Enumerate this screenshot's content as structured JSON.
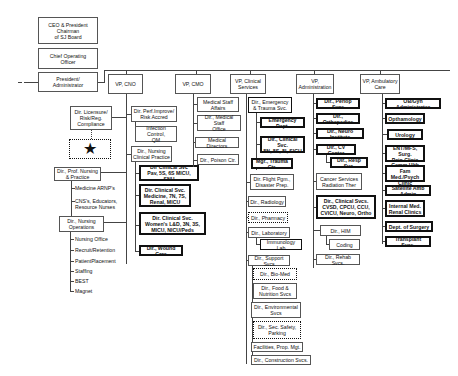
{
  "executive": {
    "ceo": "CEO & President\nChairman\nof SJ Board",
    "coo": "Chief Operating\nOfficer",
    "president": "President/\nAdministrator"
  },
  "vps": [
    {
      "label": "VP, CNO"
    },
    {
      "label": "VP, CMO"
    },
    {
      "label": "VP, Clinical\nServices"
    },
    {
      "label": "VP,\nAdministration"
    },
    {
      "label": "VP, Ambulatory\nCare"
    }
  ],
  "cno_left": {
    "licensure": "Dir. Licensure/\nRisk/Reg.\nCompliance",
    "star": "★",
    "prof_nursing": "Dir., Prof. Nursing\n& Practice",
    "prof_children": [
      "Medicine ARNP's",
      "CNS's, Educators,\nResource Nurses"
    ],
    "nursing_ops": "Dir., Nursing\nOperations",
    "ops_children": [
      "Nursing Office",
      "Recruit/Retention",
      "PatientPlacement",
      "Staffing",
      "BEST",
      "Magnet"
    ]
  },
  "cno_right": {
    "perf_improve": "Dir. Perf.Improve/\nRisk Accred",
    "infection": "Infection Control,\nQM",
    "nursing_clinical": "Dir., Nursing\nClinical Practice",
    "clinical_children": [
      "Dir Clinical Svc\nPav, 5S, 6S MICU, SNU",
      "Dir. Clinical Svc.\nMedicine, 7N, 7S,\nRenal, MICU",
      "Dir. Clinical Svc.\nWomen's L&D, 3N, 3S,\nMICU, NICU/Peds",
      "Dir., Wound Care"
    ]
  },
  "cmo": {
    "items": [
      "Medical Staff\nAffairs",
      "Dir., Medical Staff\nOffice",
      "Medical Directors",
      "Dir., Poison Ctr."
    ]
  },
  "clinical_services": {
    "emergency": "Dir., Emergency\n& Trauma Svc.",
    "emergency_children": [
      "Emergency Dept.",
      "Dir., Clinical Svc.\n8N, 8S, 8I, SICU",
      "Mgr., Trauma Ctr."
    ],
    "items": [
      "Dir. Flight Pgm.,\nDisaster Prep.",
      "Dir., Radiology",
      "Dir., Pharmacy",
      "Dir., Laboratory"
    ],
    "lab_child": "Immunology Lab",
    "support": "Dir., Support Svcs",
    "support_children": [
      "Dir., Bio-Med",
      "Dir., Food &\nNutrition Svcs",
      "Dir., Environmental\nSvcs",
      "Dir., Sec. Safety,\nParking",
      "Facilities, Prop. Mgt.",
      "Dir., Construction Svcs."
    ]
  },
  "administration": {
    "items": [
      "Dir., Periop Svcs",
      "Dir., Orthopedics",
      "Dir., Neuro Institute",
      "Dir., CV Center"
    ],
    "cv_child": "Dir., Resp Svc.",
    "cancer": "Cancer Services\nRadiation Ther",
    "cvsd": "Dir., Clinical Svcs.\nCVSD, CPCU, CCU,\nCVICU, Neuro, Ortho",
    "him": "Dir., HIM",
    "coding": "Coding",
    "rehab": "Dir., Rehab Svcs."
  },
  "ambulatory": {
    "items": [
      "OB/Gyn Administrator",
      "Opthamology",
      "Urology",
      "ENT/MFS, Surg.\nPain Clinic",
      "Comm.Hlth Fam\nMed./Psych Clinic",
      "Satellite Amb Admin",
      "Internal Med.\nRenal Clinics",
      "Dept. of Surgery",
      "Transplant Svcs."
    ]
  }
}
